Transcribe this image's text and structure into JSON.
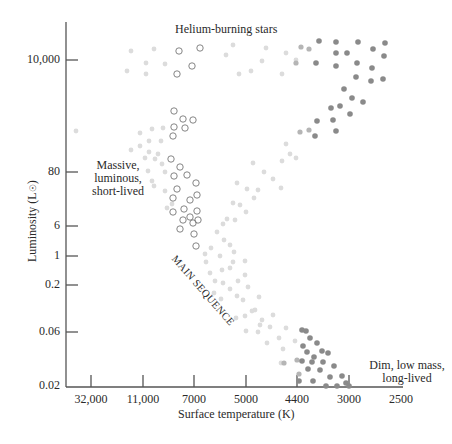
{
  "chart_data": {
    "type": "scatter",
    "title": "Helium-burning stars",
    "xlabel": "Surface temperature (K)",
    "ylabel": "Luminosity (L☉)",
    "x_ticks": [
      "32,000",
      "11,000",
      "7000",
      "5000",
      "4400",
      "3000",
      "2500"
    ],
    "y_ticks": [
      "10,000",
      "80",
      "6",
      "1",
      "0.2",
      "0.06",
      "0.02"
    ],
    "x_axis_direction": "decreasing left-to-right",
    "grid": false,
    "annotations": [
      {
        "text": "Helium-burning stars",
        "region": "top"
      },
      {
        "text": "Massive, luminous, short-lived",
        "region": "upper-left"
      },
      {
        "text": "MAIN SEQUENCE",
        "region": "diagonal-center"
      },
      {
        "text": "Dim, low mass, long-lived",
        "region": "lower-right"
      }
    ],
    "series": [
      {
        "name": "Main sequence stars (light gray dots)",
        "marker": "filled-light"
      },
      {
        "name": "Hot massive stars (open circles)",
        "marker": "open-circle"
      },
      {
        "name": "Cool red stars / red giants (dark gray dots)",
        "marker": "filled-dark"
      }
    ]
  },
  "labels": {
    "title": "Helium-burning stars",
    "ylabel": "Luminosity (L",
    "ylabel_sun": "☉",
    "ylabel_close": ")",
    "xlabel": "Surface temperature (K)",
    "main_sequence": "MAIN SEQUENCE",
    "massive": [
      "Massive,",
      "luminous,",
      "short-lived"
    ],
    "dim": [
      "Dim, low mass,",
      "long-lived"
    ]
  },
  "colors": {
    "axis": "#555555",
    "light_dot": "#dcdcdc",
    "dark_dot": "#8a8a8a",
    "mid_dot": "#b5b5b5",
    "open_circle": "#777777"
  }
}
